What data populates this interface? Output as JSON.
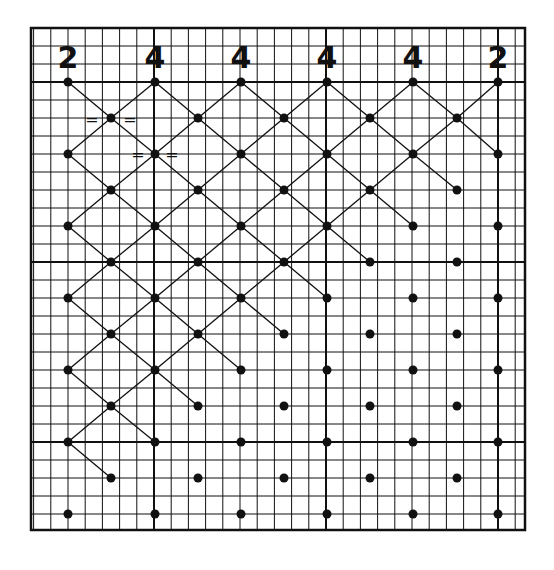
{
  "diagram": {
    "type": "hand-drawn lattice on graph paper",
    "colors": {
      "ink": "#111111",
      "paper": "#ffffff"
    },
    "top_labels": [
      {
        "text": "2",
        "x": 68
      },
      {
        "text": "4",
        "x": 155
      },
      {
        "text": "4",
        "x": 241
      },
      {
        "text": "4",
        "x": 327
      },
      {
        "text": "4",
        "x": 413
      },
      {
        "text": "2",
        "x": 498
      }
    ],
    "even_row_cols": [
      68,
      155,
      241,
      327,
      413,
      498
    ],
    "odd_row_cols": [
      111,
      198,
      284,
      370,
      457
    ],
    "rows": [
      82,
      118,
      154,
      190,
      226,
      262,
      298,
      334,
      370,
      406,
      442,
      478,
      514
    ],
    "equal_marks": [
      {
        "text": "=",
        "x": 92,
        "y": 120
      },
      {
        "text": "=",
        "x": 130,
        "y": 120
      },
      {
        "text": "=",
        "x": 138,
        "y": 155
      },
      {
        "text": "=",
        "x": 172,
        "y": 155
      }
    ]
  }
}
